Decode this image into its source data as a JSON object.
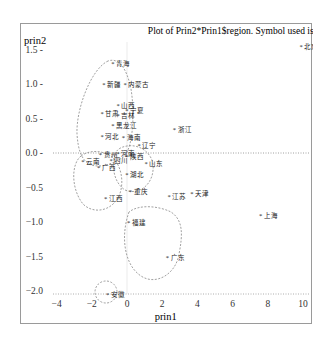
{
  "chart_data": {
    "type": "scatter",
    "title": "Plot of Prin2*Prin1$region.  Symbol used is '*'",
    "xlabel": "prin1",
    "ylabel": "prin2",
    "symbol": "*",
    "xlim": [
      -4,
      10
    ],
    "ylim": [
      -2.0,
      1.5
    ],
    "x_ticks": [
      -4,
      -2,
      0,
      2,
      4,
      6,
      8,
      10
    ],
    "y_ticks": [
      1.5,
      1.0,
      0.5,
      0.0,
      -0.5,
      -1.0,
      -1.5,
      -2.0
    ],
    "reference_lines": {
      "x": 0,
      "y": 0,
      "style": "dotted"
    },
    "points": [
      {
        "label": "北京",
        "x": 9.8,
        "y": 1.55
      },
      {
        "label": "青海",
        "x": -0.9,
        "y": 1.3
      },
      {
        "label": "新疆",
        "x": -1.4,
        "y": 1.0
      },
      {
        "label": "内蒙古",
        "x": -0.2,
        "y": 1.0
      },
      {
        "label": "山西",
        "x": -0.6,
        "y": 0.7
      },
      {
        "label": "宁夏",
        "x": -0.1,
        "y": 0.62
      },
      {
        "label": "甘肃",
        "x": -1.5,
        "y": 0.58
      },
      {
        "label": "吉林",
        "x": -0.6,
        "y": 0.55
      },
      {
        "label": "黑龙江",
        "x": -0.9,
        "y": 0.4
      },
      {
        "label": "河北",
        "x": -1.5,
        "y": 0.25
      },
      {
        "label": "海南",
        "x": -0.3,
        "y": 0.23
      },
      {
        "label": "辽宁",
        "x": 0.6,
        "y": 0.12
      },
      {
        "label": "浙江",
        "x": 2.6,
        "y": 0.35
      },
      {
        "label": "河南",
        "x": -0.6,
        "y": 0.0
      },
      {
        "label": "陕西",
        "x": -0.1,
        "y": -0.05
      },
      {
        "label": "贵州",
        "x": -1.6,
        "y": -0.02
      },
      {
        "label": "四川",
        "x": -1.0,
        "y": -0.1
      },
      {
        "label": "云南",
        "x": -2.6,
        "y": -0.12
      },
      {
        "label": "广西",
        "x": -1.7,
        "y": -0.2
      },
      {
        "label": "山东",
        "x": 1.0,
        "y": -0.15
      },
      {
        "label": "湖北",
        "x": -0.1,
        "y": -0.3
      },
      {
        "label": "重庆",
        "x": 0.1,
        "y": -0.55
      },
      {
        "label": "江西",
        "x": -1.3,
        "y": -0.65
      },
      {
        "label": "江苏",
        "x": 2.3,
        "y": -0.62
      },
      {
        "label": "天津",
        "x": 3.6,
        "y": -0.58
      },
      {
        "label": "上海",
        "x": 7.5,
        "y": -0.9
      },
      {
        "label": "福建",
        "x": 0.0,
        "y": -1.0
      },
      {
        "label": "广东",
        "x": 2.2,
        "y": -1.5
      },
      {
        "label": "安徽",
        "x": -1.2,
        "y": -2.05
      }
    ],
    "grid": false,
    "clusters": 4
  }
}
